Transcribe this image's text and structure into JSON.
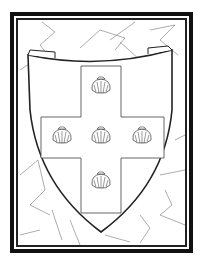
{
  "image": {
    "subject": "coat of arms coloring page",
    "description": "Heraldic shield with a cross charged with five scallop shells, on a cracked stone background inside a black frame",
    "charges": [
      "scallop-shell",
      "scallop-shell",
      "scallop-shell",
      "scallop-shell",
      "scallop-shell"
    ],
    "colors": {
      "frame": "#111111",
      "line": "#222222",
      "background": "#ffffff",
      "crack_lines": "#888888"
    }
  }
}
